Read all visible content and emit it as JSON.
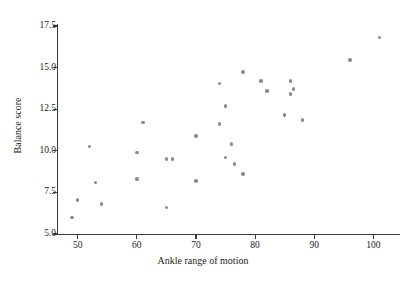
{
  "chart_data": {
    "type": "scatter",
    "title": "",
    "xlabel": "Ankle range of motion",
    "ylabel": "Balance score",
    "xlim": [
      46.5,
      104.5
    ],
    "ylim": [
      5.0,
      17.5
    ],
    "xticks": [
      50,
      60,
      70,
      80,
      90,
      100
    ],
    "xtick_labels": [
      "50",
      "60",
      "70",
      "80",
      "90",
      "100"
    ],
    "yticks": [
      5.0,
      7.5,
      10.0,
      12.5,
      15.0,
      17.5
    ],
    "ytick_labels": [
      "5.0",
      "7.5",
      "10.0",
      "12.5",
      "15.0",
      "17.5"
    ],
    "grid": false,
    "legend": null,
    "marker_color": "#8a8a8a",
    "axis_color": "#3a3a3a",
    "points": [
      {
        "x": 49,
        "y": 6.0
      },
      {
        "x": 50,
        "y": 7.05
      },
      {
        "x": 52,
        "y": 10.25
      },
      {
        "x": 53,
        "y": 8.1
      },
      {
        "x": 54,
        "y": 6.8
      },
      {
        "x": 60,
        "y": 9.9
      },
      {
        "x": 60,
        "y": 8.3
      },
      {
        "x": 61,
        "y": 11.7
      },
      {
        "x": 65,
        "y": 9.5
      },
      {
        "x": 65,
        "y": 6.6
      },
      {
        "x": 66,
        "y": 9.5
      },
      {
        "x": 70,
        "y": 10.9
      },
      {
        "x": 70,
        "y": 8.2
      },
      {
        "x": 74,
        "y": 14.05
      },
      {
        "x": 74,
        "y": 11.6
      },
      {
        "x": 75,
        "y": 12.7
      },
      {
        "x": 75,
        "y": 9.6
      },
      {
        "x": 76,
        "y": 10.4
      },
      {
        "x": 76.5,
        "y": 9.2
      },
      {
        "x": 78,
        "y": 14.75
      },
      {
        "x": 78,
        "y": 8.6
      },
      {
        "x": 81,
        "y": 14.2
      },
      {
        "x": 82,
        "y": 13.6
      },
      {
        "x": 85,
        "y": 12.15
      },
      {
        "x": 86,
        "y": 14.2
      },
      {
        "x": 86,
        "y": 13.4
      },
      {
        "x": 86.5,
        "y": 13.7
      },
      {
        "x": 88,
        "y": 11.85
      },
      {
        "x": 96,
        "y": 15.45
      },
      {
        "x": 101,
        "y": 16.8
      }
    ]
  }
}
